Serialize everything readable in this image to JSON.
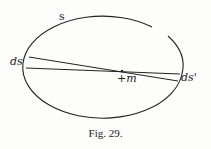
{
  "figure": {
    "labels": {
      "arc": "s",
      "left_element": "ds",
      "right_element": "ds'",
      "center_point": "+m"
    },
    "caption": "Fig. 29."
  }
}
